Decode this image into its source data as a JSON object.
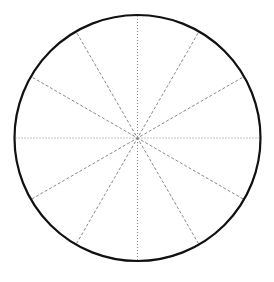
{
  "diagram": {
    "type": "circle-divided-into-sectors",
    "sector_count": 12,
    "sector_angle_degrees": 30,
    "axes": [
      {
        "name": "vertical-diameter",
        "angle_degrees": 90,
        "style": "dotted"
      },
      {
        "name": "horizontal-diameter",
        "angle_degrees": 0,
        "style": "dotted"
      }
    ],
    "diagonals": [
      {
        "name": "diameter-30",
        "angle_degrees": 30,
        "style": "dashed"
      },
      {
        "name": "diameter-60",
        "angle_degrees": 60,
        "style": "dashed"
      },
      {
        "name": "diameter-120",
        "angle_degrees": 120,
        "style": "dashed"
      },
      {
        "name": "diameter-150",
        "angle_degrees": 150,
        "style": "dashed"
      }
    ],
    "colors": {
      "outline": "#111111",
      "dotted_line": "#888888",
      "dashed_line": "#8a8a8a",
      "background": "#ffffff"
    }
  }
}
